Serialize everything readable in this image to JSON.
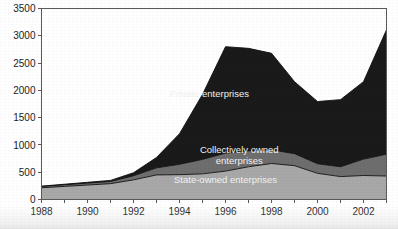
{
  "chart_data": {
    "type": "area",
    "stacked": true,
    "title": "",
    "subtitle": "",
    "xlabel": "",
    "ylabel": "",
    "grid": false,
    "legend_position": "inline-labels",
    "x": [
      1988,
      1989,
      1990,
      1991,
      1992,
      1993,
      1994,
      1995,
      1996,
      1997,
      1998,
      1999,
      2000,
      2001,
      2002,
      2003
    ],
    "x_tick_labels": [
      "1988",
      "1990",
      "1992",
      "1994",
      "1996",
      "1998",
      "2000",
      "2002"
    ],
    "x_tick_values": [
      1988,
      1990,
      1992,
      1994,
      1996,
      1998,
      2000,
      2002
    ],
    "xlim": [
      1988,
      2003
    ],
    "ylim": [
      0,
      3500
    ],
    "y_tick_labels": [
      "0",
      "500",
      "1000",
      "1500",
      "2000",
      "2500",
      "3000",
      "3500"
    ],
    "y_tick_values": [
      0,
      500,
      1000,
      1500,
      2000,
      2500,
      3000,
      3500
    ],
    "series": [
      {
        "name": "State-owned enterprises",
        "color": "#a8a8a8",
        "values": [
          215,
          240,
          265,
          290,
          360,
          450,
          455,
          470,
          520,
          600,
          660,
          620,
          480,
          420,
          440,
          430
        ]
      },
      {
        "name": "Collectively owned enterprises",
        "color": "#6e6e6e",
        "values": [
          25,
          30,
          35,
          40,
          75,
          130,
          190,
          265,
          330,
          290,
          250,
          220,
          175,
          180,
          300,
          400
        ]
      },
      {
        "name": "Private enterprises",
        "color": "#1a1a1a",
        "values": [
          5,
          10,
          15,
          20,
          55,
          190,
          560,
          1190,
          1950,
          1880,
          1770,
          1320,
          1140,
          1230,
          1420,
          2280
        ]
      }
    ],
    "series_label_positions": [
      {
        "label": "State-owned enterprises",
        "x": 1996.0,
        "y": 300,
        "lines": [
          "State-owned enterprises"
        ]
      },
      {
        "label": "Collectively owned enterprises",
        "x": 1996.6,
        "y": 860,
        "lines": [
          "Collectively owned",
          "enterprises"
        ]
      },
      {
        "label": "Private enterprises",
        "x": 1995.3,
        "y": 1880,
        "lines": [
          "Private enterprises"
        ]
      }
    ]
  },
  "colors": {
    "axis": "#5a5a5a",
    "text": "#1c1c1c",
    "label_text": "#f2f2f2",
    "background": "#ffffff"
  }
}
